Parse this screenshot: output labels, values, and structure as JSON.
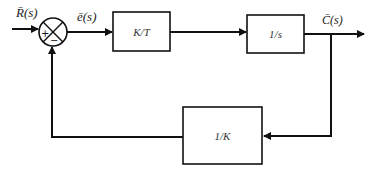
{
  "diagram": {
    "type": "block-diagram",
    "title": "",
    "signals": {
      "input": "R̄(s)",
      "error": "ē(s)",
      "output": "C̄(s)"
    },
    "summing_junction": {
      "plus_sign": "+",
      "minus_sign": "−"
    },
    "blocks": {
      "forward_gain": "K/T",
      "integrator": "1/s",
      "feedback_gain": "1/K"
    },
    "colors": {
      "stroke": "#111111",
      "background": "#ffffff"
    }
  }
}
